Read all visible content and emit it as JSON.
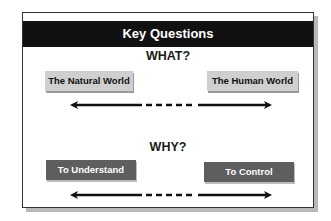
{
  "title": "Key Questions",
  "sections": [
    {
      "question": "WHAT?",
      "left": "The Natural World",
      "right": "The Human World",
      "style": "light"
    },
    {
      "question": "WHY?",
      "left": "To Understand",
      "right": "To Control",
      "style": "dark"
    }
  ],
  "colors": {
    "header_bg": "#111111",
    "light_box": "#cfcfcf",
    "dark_box": "#5e5e5e",
    "arrow": "#111111"
  },
  "icons": {
    "arrow": "double-headed-arrow-with-dashed-center"
  }
}
